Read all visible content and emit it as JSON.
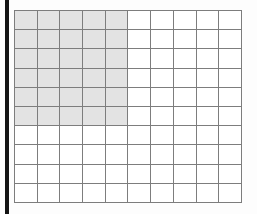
{
  "figure": {
    "kind": "shaded-fraction-grid",
    "background_color": "#fdfdfd"
  },
  "left_rule": {
    "name": "left-margin-rule",
    "color": "#141414"
  },
  "chart_data": {
    "type": "heatmap",
    "title": "",
    "subtitle": "",
    "xlabel": "",
    "ylabel": "",
    "columns": 10,
    "rows": 10,
    "shaded_columns": 5,
    "shaded_rows": 6,
    "shaded_cell_count": 30,
    "total_cell_count": 100,
    "shaded_fraction": "30/100",
    "grid": true,
    "legend": "none",
    "colors": {
      "shaded": "#e3e3e3",
      "unshaded": "#ffffff",
      "gridline": "#7d7d7d"
    },
    "cells": [
      [
        1,
        1,
        1,
        1,
        1,
        0,
        0,
        0,
        0,
        0
      ],
      [
        1,
        1,
        1,
        1,
        1,
        0,
        0,
        0,
        0,
        0
      ],
      [
        1,
        1,
        1,
        1,
        1,
        0,
        0,
        0,
        0,
        0
      ],
      [
        1,
        1,
        1,
        1,
        1,
        0,
        0,
        0,
        0,
        0
      ],
      [
        1,
        1,
        1,
        1,
        1,
        0,
        0,
        0,
        0,
        0
      ],
      [
        1,
        1,
        1,
        1,
        1,
        0,
        0,
        0,
        0,
        0
      ],
      [
        0,
        0,
        0,
        0,
        0,
        0,
        0,
        0,
        0,
        0
      ],
      [
        0,
        0,
        0,
        0,
        0,
        0,
        0,
        0,
        0,
        0
      ],
      [
        0,
        0,
        0,
        0,
        0,
        0,
        0,
        0,
        0,
        0
      ],
      [
        0,
        0,
        0,
        0,
        0,
        0,
        0,
        0,
        0,
        0
      ]
    ]
  }
}
